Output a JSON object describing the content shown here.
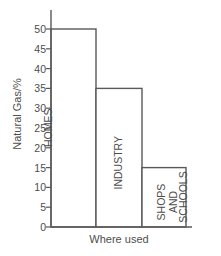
{
  "chart_data": {
    "type": "bar",
    "title": "",
    "subtitle": "",
    "xlabel": "Where used",
    "ylabel": "Natural Gas/%",
    "categories": [
      "HOMES",
      "INDUSTRY",
      "SHOPS AND SCHOOLS"
    ],
    "values": [
      50,
      35,
      15
    ],
    "ylim": [
      0,
      50
    ],
    "yticks": [
      0,
      5,
      10,
      15,
      20,
      25,
      30,
      35,
      40,
      45,
      50
    ],
    "ytick_labels": [
      "0",
      "5",
      "10",
      "15",
      "20",
      "25",
      "30",
      "35",
      "40",
      "45",
      "50"
    ],
    "xticks": [],
    "grid": false,
    "legend": false,
    "legend_position": "none",
    "bar_fill": "#ffffff",
    "bar_stroke": "#595959",
    "axis_color": "#595959",
    "text_color": "#4d4d4d",
    "background": "#ffffff",
    "bars": [
      {
        "category": "HOMES",
        "value": 50,
        "label_lines": [
          "HOMES"
        ],
        "x_left_px": 51,
        "x_right_px": 96
      },
      {
        "category": "INDUSTRY",
        "value": 35,
        "label_lines": [
          "INDUSTRY"
        ],
        "x_left_px": 96,
        "x_right_px": 142
      },
      {
        "category": "SHOPS AND SCHOOLS",
        "value": 15,
        "label_lines": [
          "SHOPS",
          "AND",
          "SCHOOLS"
        ],
        "x_left_px": 142,
        "x_right_px": 186
      }
    ]
  },
  "axes": {
    "y_title": "Natural Gas/%",
    "x_title": "Where used"
  },
  "bar_labels": {
    "homes": "HOMES",
    "industry": "INDUSTRY",
    "shops_line1": "SHOPS",
    "shops_line2": "AND",
    "shops_line3": "SCHOOLS"
  },
  "ticks": {
    "t50": "50",
    "t45": "45",
    "t40": "40",
    "t35": "35",
    "t30": "30",
    "t25": "25",
    "t20": "20",
    "t15": "15",
    "t10": "10",
    "t5": "5",
    "t0": "0"
  }
}
